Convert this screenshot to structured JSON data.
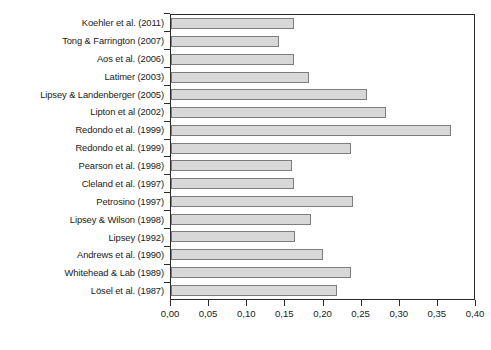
{
  "chart_data": {
    "type": "bar",
    "orientation": "horizontal",
    "title": "",
    "xlabel": "",
    "ylabel": "",
    "xlim": [
      0.0,
      0.4
    ],
    "xticks": [
      0.0,
      0.05,
      0.1,
      0.15,
      0.2,
      0.25,
      0.3,
      0.35,
      0.4
    ],
    "xtick_labels": [
      "0,00",
      "0,05",
      "0,10",
      "0,15",
      "0,20",
      "0,25",
      "0,30",
      "0,35",
      "0,40"
    ],
    "grid": false,
    "legend": null,
    "decimal_separator": ",",
    "bar_fill_color": "#d8d8d8",
    "bar_edge_color": "#7d7d7d",
    "axis_color": "#2b2b2b",
    "categories": [
      "Koehler et al. (2011)",
      "Tong & Farrington (2007)",
      "Aos et al. (2006)",
      "Latimer (2003)",
      "Lipsey & Landenberger (2005)",
      "Lipton et al (2002)",
      "Redondo et al. (1999)",
      "Redondo et al. (1999)",
      "Pearson et al. (1998)",
      "Cleland et al. (1997)",
      "Petrosino (1997)",
      "Lipsey & Wilson (1998)",
      "Lipsey (1992)",
      "Andrews et al. (1990)",
      "Whitehead & Lab (1989)",
      "Lösel et al. (1987)"
    ],
    "values": [
      0.162,
      0.142,
      0.162,
      0.182,
      0.259,
      0.284,
      0.37,
      0.238,
      0.16,
      0.163,
      0.24,
      0.185,
      0.164,
      0.201,
      0.237,
      0.219
    ]
  }
}
